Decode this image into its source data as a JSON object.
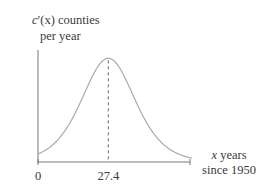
{
  "chart_data": {
    "type": "line",
    "title": "",
    "ylabel_line1_prefix": "c",
    "ylabel_line1_prime": "′",
    "ylabel_line1_var": "(x)",
    "ylabel_line1_suffix": " counties",
    "ylabel_line2": "per year",
    "xlabel_line1_var": "x",
    "xlabel_line1_suffix": " years",
    "xlabel_line2": "since 1950",
    "x_ticks": [
      {
        "value": 0,
        "label": "0"
      },
      {
        "value": 27.4,
        "label": "27.4"
      }
    ],
    "xlim": [
      0,
      60
    ],
    "ylim": [
      0,
      1.08
    ],
    "peak_x": 27.4,
    "peak_y": 1.0,
    "curve": "logistic-derivative (bell-shaped) peaking at x = 27.4",
    "curve_scale": 7.0,
    "dashed_line_at_x": 27.4,
    "grid": false,
    "legend": "none",
    "colors": {
      "axis": "#777777",
      "curve": "#aaaaaa",
      "dashed": "#666666"
    }
  }
}
